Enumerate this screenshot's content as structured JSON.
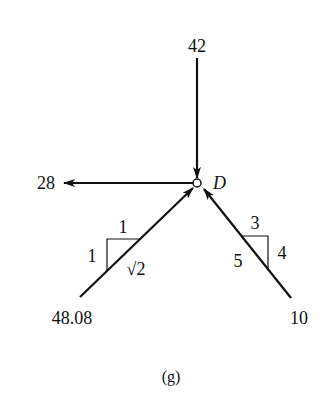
{
  "diagram": {
    "node": {
      "label": "D"
    },
    "forces": [
      {
        "id": "top",
        "value": "42",
        "direction": "down-into-node"
      },
      {
        "id": "left",
        "value": "28",
        "direction": "left-away-from-node"
      },
      {
        "id": "lower-left",
        "value": "48.08",
        "direction": "up-right-into-node"
      },
      {
        "id": "lower-right",
        "value": "10",
        "direction": "up-left-into-node"
      }
    ],
    "slope_left": {
      "horizontal": "1",
      "vertical": "1",
      "hypotenuse": "√2"
    },
    "slope_right": {
      "horizontal": "3",
      "vertical": "4",
      "hypotenuse": "5"
    },
    "caption": "(g)"
  }
}
